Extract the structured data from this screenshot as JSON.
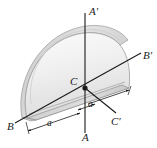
{
  "figure": {
    "type": "engineering-mechanics-diagram",
    "body": {
      "shape": "semicircular plate",
      "radius_label": "a",
      "half_width_label": "a"
    },
    "colors": {
      "plate_face": "#e6e6e6",
      "plate_face_light": "#f4f4f4",
      "plate_edge_dark": "#b9b9b9",
      "plate_top_strip": "#d2d2d2",
      "outline": "#8a8a8a",
      "axis": "#1a1a1a",
      "text": "#1a1a1a",
      "background": "#ffffff"
    },
    "axes": [
      {
        "id": "A",
        "label": "A",
        "x": 82,
        "y": 132
      },
      {
        "id": "Ap",
        "label": "A′",
        "x": 89,
        "y": 6
      },
      {
        "id": "B",
        "label": "B",
        "x": 7,
        "y": 121
      },
      {
        "id": "Bp",
        "label": "B′",
        "x": 143,
        "y": 50
      },
      {
        "id": "C",
        "label": "C",
        "x": 70,
        "y": 76
      },
      {
        "id": "Cp",
        "label": "C′",
        "x": 111,
        "y": 116
      }
    ],
    "dimensions": [
      {
        "id": "dim-a-long",
        "label": "a",
        "x": 47,
        "y": 119
      },
      {
        "id": "dim-a-short",
        "label": "a",
        "x": 88,
        "y": 100
      }
    ],
    "centroid_marker": {
      "label": "C",
      "x": 85,
      "y": 88
    }
  }
}
